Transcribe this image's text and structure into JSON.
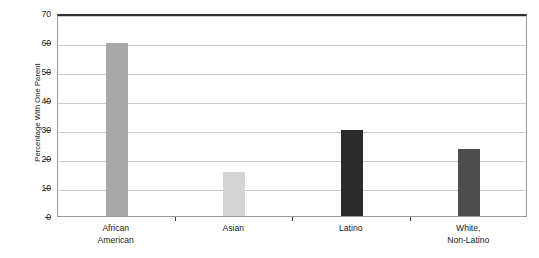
{
  "chart_data": {
    "type": "bar",
    "title": "",
    "xlabel": "",
    "ylabel": "Percentage With One Parent",
    "ylim": [
      0,
      70
    ],
    "yticks": [
      0,
      10,
      20,
      30,
      40,
      50,
      60,
      70
    ],
    "ytick_labels": [
      "0",
      "10",
      "20",
      "30",
      "40",
      "50",
      "60",
      "70"
    ],
    "grid": true,
    "legend": "none",
    "categories": [
      "African American",
      "Asian",
      "Latino",
      "White, Non-Latino"
    ],
    "category_lines": [
      [
        "African",
        "American"
      ],
      [
        "Asian",
        ""
      ],
      [
        "Latino",
        ""
      ],
      [
        "White,",
        "Non-Latino"
      ]
    ],
    "values": [
      59.5,
      15.2,
      29.5,
      23.0
    ],
    "bar_colors": [
      "#a8a8a8",
      "#d4d4d4",
      "#2b2b2b",
      "#4d4d4d"
    ]
  },
  "axis": {
    "y_title": "Percentage With One Parent"
  },
  "source": {
    "note": ""
  }
}
